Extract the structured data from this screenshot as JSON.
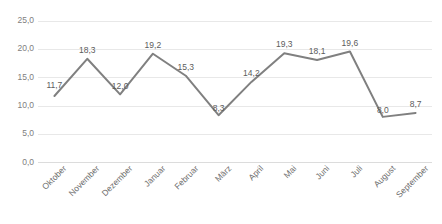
{
  "chart_data": {
    "type": "line",
    "title": "",
    "subtitle": "",
    "xlabel": "",
    "ylabel": "",
    "categories": [
      "Oktober",
      "November",
      "Dezember",
      "Januar",
      "Februar",
      "März",
      "April",
      "Mai",
      "Juni",
      "Juli",
      "August",
      "September"
    ],
    "values": [
      11.7,
      18.3,
      12.0,
      19.2,
      15.3,
      8.3,
      14.2,
      19.3,
      18.1,
      19.6,
      8.0,
      8.7
    ],
    "value_labels": [
      "11,7",
      "18,3",
      "12,0",
      "19,2",
      "15,3",
      "8,3",
      "14,2",
      "19,3",
      "18,1",
      "19,6",
      "8,0",
      "8,7"
    ],
    "ylim": [
      0,
      25
    ],
    "ytick_values": [
      25,
      20,
      15,
      10,
      5,
      0
    ],
    "ytick_labels": [
      "25,0",
      "20,0",
      "15,0",
      "10,0",
      "5,0",
      "0,0"
    ],
    "grid": true,
    "grid_axis": "y",
    "legend": false,
    "legend_position": "none",
    "series": [
      {
        "name": "",
        "color": "#808080",
        "values": [
          11.7,
          18.3,
          12.0,
          19.2,
          15.3,
          8.3,
          14.2,
          19.3,
          18.1,
          19.6,
          8.0,
          8.7
        ]
      }
    ],
    "decimal_separator": ",",
    "markers": false,
    "line_width": 2,
    "colors": {
      "line": "#808080",
      "grid": "#e8e8e8",
      "axis_text": "#808080",
      "data_label_text": "#5c5c5c",
      "background": "#ffffff"
    }
  }
}
